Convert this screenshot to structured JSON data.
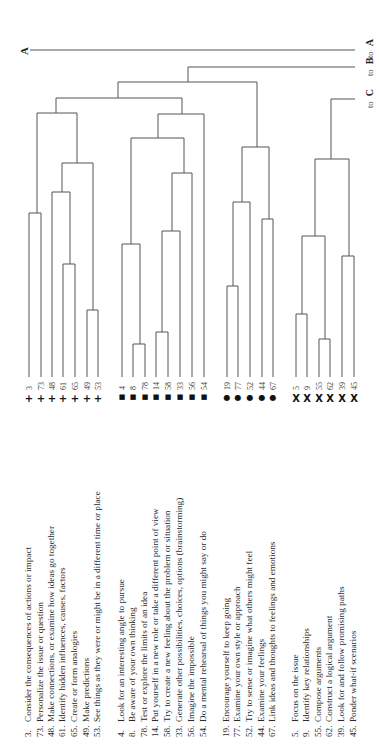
{
  "diagram": {
    "type": "dendrogram",
    "orientation": "rotated-90",
    "arrow_label": "A",
    "connectors": [
      {
        "prefix": "to",
        "target": "A"
      },
      {
        "prefix": "to",
        "target": "B"
      },
      {
        "prefix": "to",
        "target": "C"
      }
    ],
    "groups": [
      {
        "symbol": "+",
        "items": [
          {
            "num": "3",
            "label": "Consider the consequences of actions or impact"
          },
          {
            "num": "73",
            "label": "Personalize the issue or question"
          },
          {
            "num": "48",
            "label": "Make connections, or examine how ideas go together"
          },
          {
            "num": "61",
            "label": "Identify hidden influences, causes, factors"
          },
          {
            "num": "65",
            "label": "Create or form analogies"
          },
          {
            "num": "49",
            "label": "Make predictions"
          },
          {
            "num": "53",
            "label": "See things as they were or might be in a different time or place"
          }
        ]
      },
      {
        "symbol": "■",
        "items": [
          {
            "num": "4",
            "label": "Look for an interesting angle to pursue"
          },
          {
            "num": "8",
            "label": "Be aware of your own thinking"
          },
          {
            "num": "78",
            "label": "Test or explore the limits of an idea"
          },
          {
            "num": "14",
            "label": "Put yourself in a new role or take a different point of view"
          },
          {
            "num": "58",
            "label": "Try to create a new feeling about the problem or situation"
          },
          {
            "num": "33",
            "label": "Generate other possibilities, choices, options (brainstorming)"
          },
          {
            "num": "56",
            "label": "Imagine the impossible"
          },
          {
            "num": "54",
            "label": "Do a mental rehearsal of things you might say or do"
          }
        ]
      },
      {
        "symbol": "●",
        "items": [
          {
            "num": "19",
            "label": "Encourage yourself to keep going"
          },
          {
            "num": "77",
            "label": "Examine your own style or approach"
          },
          {
            "num": "52",
            "label": "Try to sense or imagine what others might feel"
          },
          {
            "num": "44",
            "label": "Examine your feelings"
          },
          {
            "num": "67",
            "label": "Link ideas and thoughts to feelings and emotions"
          }
        ]
      },
      {
        "symbol": "X",
        "items": [
          {
            "num": "5",
            "label": "Focus on the issue"
          },
          {
            "num": "9",
            "label": "Identify key relationships"
          },
          {
            "num": "55",
            "label": "Compose arguments"
          },
          {
            "num": "62",
            "label": "Construct a logical argument"
          },
          {
            "num": "39",
            "label": "Look for and follow promising paths"
          },
          {
            "num": "45",
            "label": "Ponder what-if scenarios"
          }
        ]
      }
    ]
  }
}
